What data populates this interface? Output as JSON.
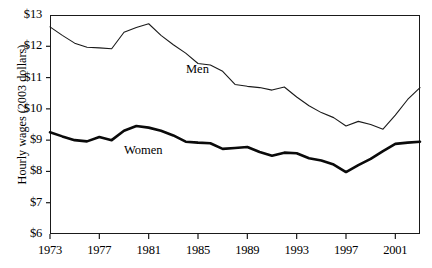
{
  "chart_data": {
    "type": "line",
    "title": "",
    "xlabel": "",
    "ylabel": "Hourly wages (2003 dollars)",
    "xlim": [
      1973,
      2003
    ],
    "ylim": [
      6,
      13
    ],
    "grid": false,
    "legend_position": "inline-annotations",
    "y_tick_labels": [
      "$13",
      "$12",
      "$11",
      "$10",
      "$9",
      "$8",
      "$7",
      "$6"
    ],
    "y_tick_values": [
      13,
      12,
      11,
      10,
      9,
      8,
      7,
      6
    ],
    "x_tick_labels": [
      "1973",
      "1977",
      "1981",
      "1985",
      "1989",
      "1993",
      "1997",
      "2001"
    ],
    "x_tick_values": [
      1973,
      1977,
      1981,
      1985,
      1989,
      1993,
      1997,
      2001
    ],
    "x": [
      1973,
      1974,
      1975,
      1976,
      1977,
      1978,
      1979,
      1980,
      1981,
      1982,
      1983,
      1984,
      1985,
      1986,
      1987,
      1988,
      1989,
      1990,
      1991,
      1992,
      1993,
      1994,
      1995,
      1996,
      1997,
      1998,
      1999,
      2000,
      2001,
      2002,
      2003
    ],
    "series": [
      {
        "name": "Men",
        "label": "Men",
        "color": "#1a1a1a",
        "line_width": 1.1,
        "values": [
          12.62,
          12.35,
          12.1,
          11.97,
          11.95,
          11.92,
          12.45,
          12.6,
          12.72,
          12.35,
          12.05,
          11.78,
          11.45,
          11.4,
          11.2,
          10.78,
          10.72,
          10.68,
          10.6,
          10.7,
          10.38,
          10.1,
          9.88,
          9.72,
          9.45,
          9.6,
          9.5,
          9.35,
          9.8,
          10.3,
          10.68
        ],
        "value_labels": []
      },
      {
        "name": "Women",
        "label": "Women",
        "color": "#0a0a0a",
        "line_width": 2.6,
        "values": [
          9.25,
          9.12,
          9.0,
          8.96,
          9.1,
          9.0,
          9.3,
          9.45,
          9.4,
          9.3,
          9.15,
          8.95,
          8.92,
          8.9,
          8.72,
          8.75,
          8.78,
          8.62,
          8.5,
          8.6,
          8.58,
          8.42,
          8.35,
          8.22,
          7.98,
          8.2,
          8.4,
          8.65,
          8.88,
          8.92,
          8.95
        ],
        "value_labels": []
      }
    ],
    "men_final_plateau_note": "",
    "men_end_values": [
      10.68,
      10.55,
      10.52
    ],
    "women_end_values": [
      8.9,
      8.95,
      8.93
    ]
  },
  "axis": {
    "y_title": "Hourly wages (2003 dollars)",
    "ticks_y": [
      {
        "label": "$13",
        "value": 13
      },
      {
        "label": "$12",
        "value": 12
      },
      {
        "label": "$11",
        "value": 11
      },
      {
        "label": "$10",
        "value": 10
      },
      {
        "label": "$9",
        "value": 9
      },
      {
        "label": "$8",
        "value": 8
      },
      {
        "label": "$7",
        "value": 7
      },
      {
        "label": "$6",
        "value": 6
      }
    ],
    "ticks_x": [
      {
        "label": "1973",
        "value": 1973
      },
      {
        "label": "1977",
        "value": 1977
      },
      {
        "label": "1981",
        "value": 1981
      },
      {
        "label": "1985",
        "value": 1985
      },
      {
        "label": "1989",
        "value": 1989
      },
      {
        "label": "1993",
        "value": 1993
      },
      {
        "label": "1997",
        "value": 1997
      },
      {
        "label": "2001",
        "value": 2001
      }
    ]
  },
  "annotations": {
    "men_label": "Men",
    "women_label": "Women"
  }
}
